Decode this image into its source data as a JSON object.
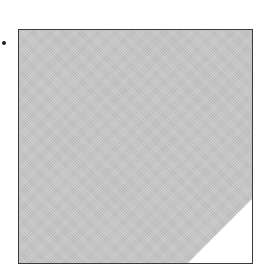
{
  "figure": {
    "shape": "square",
    "fill_color": "#c4c4c4",
    "border_color": "#3a3a3a",
    "corner_cutout": {
      "position": "bottom-right",
      "color": "#ffffff"
    },
    "marker": {
      "shape": "dot",
      "color": "#222222"
    }
  }
}
